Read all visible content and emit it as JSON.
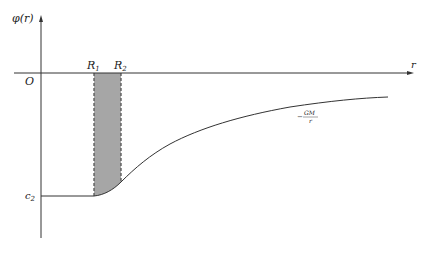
{
  "figure": {
    "y_axis_label": "φ(r)",
    "x_axis_label": "r",
    "origin_label": "O",
    "r1_label": "R",
    "r1_sub": "1",
    "r2_label": "R",
    "r2_sub": "2",
    "c2_label": "c",
    "c2_sub": "2",
    "curve_label_num": "GM",
    "curve_label_den": "r",
    "curve_label_sign": "−",
    "colors": {
      "axis": "#333333",
      "curve": "#333333",
      "shade": "#a6a6a6",
      "dash": "#555555"
    }
  }
}
